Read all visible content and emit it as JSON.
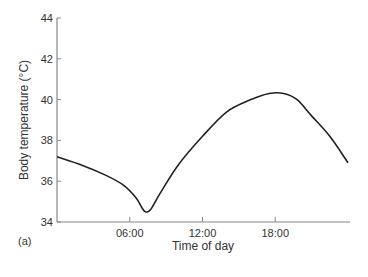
{
  "panel_label": "(a)",
  "chart_data": {
    "type": "line",
    "title": "",
    "xlabel": "Time of day",
    "ylabel": "Body temperature (°C)",
    "xlim": [
      0,
      24
    ],
    "ylim": [
      34,
      44
    ],
    "x_ticks": [
      6,
      12,
      18
    ],
    "x_tick_labels": [
      "06:00",
      "12:00",
      "18:00"
    ],
    "y_ticks": [
      34,
      36,
      38,
      40,
      42,
      44
    ],
    "y_tick_labels": [
      "34",
      "36",
      "38",
      "40",
      "42",
      "44"
    ],
    "grid": false,
    "legend": null,
    "series": [
      {
        "name": "Body temperature",
        "color": "#222222",
        "x": [
          0,
          2,
          4,
          5.5,
          6.5,
          7.0,
          7.3,
          7.7,
          8.5,
          10,
          12,
          14,
          16,
          17.5,
          18.7,
          19.8,
          21,
          22.5,
          24
        ],
        "y": [
          37.2,
          36.8,
          36.3,
          35.8,
          35.2,
          34.7,
          34.5,
          34.6,
          35.4,
          36.8,
          38.2,
          39.4,
          40.0,
          40.3,
          40.3,
          40.0,
          39.2,
          38.2,
          36.9
        ]
      }
    ]
  }
}
